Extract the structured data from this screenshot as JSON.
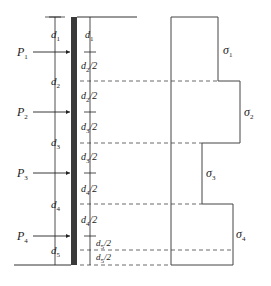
{
  "diagram": {
    "type": "retaining wall with anchor loads and stepped stress distribution",
    "loads": [
      {
        "label": "P",
        "sub": "1",
        "y": 52
      },
      {
        "label": "P",
        "sub": "2",
        "y": 112
      },
      {
        "label": "P",
        "sub": "3",
        "y": 173
      },
      {
        "label": "P",
        "sub": "4",
        "y": 236
      }
    ],
    "left_dimensions": [
      {
        "label": "d",
        "sub": "1"
      },
      {
        "label": "d",
        "sub": "2"
      },
      {
        "label": "d",
        "sub": "3"
      },
      {
        "label": "d",
        "sub": "4"
      },
      {
        "label": "d",
        "sub": "5"
      }
    ],
    "right_dimensions": [
      {
        "label": "d",
        "sub": "1",
        "suffix": ""
      },
      {
        "label": "d",
        "sub": "2",
        "suffix": "/2"
      },
      {
        "label": "d",
        "sub": "2",
        "suffix": "/2"
      },
      {
        "label": "d",
        "sub": "3",
        "suffix": "/2"
      },
      {
        "label": "d",
        "sub": "3",
        "suffix": "/2"
      },
      {
        "label": "d",
        "sub": "4",
        "suffix": "/2"
      },
      {
        "label": "d",
        "sub": "4",
        "suffix": "/2"
      },
      {
        "label": "d",
        "sub": "5",
        "suffix": "/2"
      },
      {
        "label": "d",
        "sub": "5",
        "suffix": "/2"
      }
    ],
    "stresses": [
      {
        "label": "σ",
        "sub": "1"
      },
      {
        "label": "σ",
        "sub": "2"
      },
      {
        "label": "σ",
        "sub": "3"
      },
      {
        "label": "σ",
        "sub": "4"
      }
    ]
  }
}
